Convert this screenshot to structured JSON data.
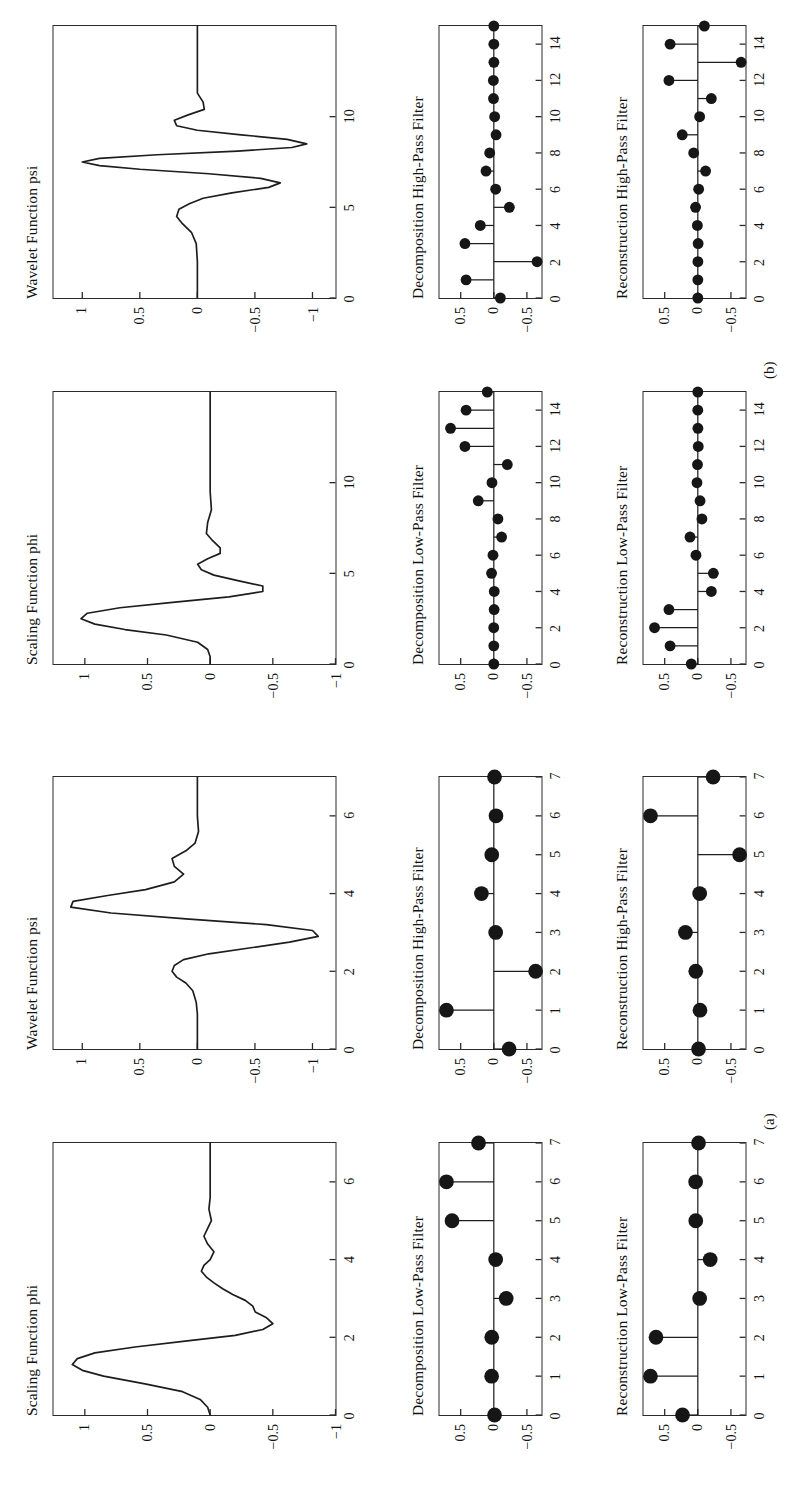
{
  "figure": {
    "panel_a_label": "(a)",
    "panel_b_label": "(b)",
    "titles": {
      "scaling": "Scaling Function phi",
      "wavelet": "Wavelet Function psi",
      "dec_low": "Decomposition Low-Pass Filter",
      "dec_high": "Decomposition High-Pass Filter",
      "rec_low": "Reconstruction Low-Pass Filter",
      "rec_high": "Reconstruction High-Pass Filter"
    }
  },
  "chart_data": [
    {
      "id": "a-scaling",
      "panel": "(a)",
      "type": "line",
      "title": "Scaling Function phi",
      "xlabel": "",
      "ylabel": "",
      "xlim": [
        0,
        7
      ],
      "ylim": [
        -1,
        1.25
      ],
      "xticks": [
        0,
        2,
        4,
        6
      ],
      "xticklabels": [
        "0",
        "2",
        "4",
        "6"
      ],
      "yticks": [
        -1,
        -0.5,
        0,
        0.5,
        1
      ],
      "yticklabels": [
        "-1",
        "-0.5",
        "0",
        "0.5",
        "1"
      ],
      "grid": false,
      "legend": false,
      "x": [
        0,
        0.2,
        0.4,
        0.6,
        0.8,
        1.0,
        1.15,
        1.3,
        1.45,
        1.6,
        1.75,
        1.9,
        2.05,
        2.2,
        2.35,
        2.5,
        2.65,
        2.8,
        2.95,
        3.1,
        3.25,
        3.4,
        3.55,
        3.7,
        3.85,
        4.0,
        4.2,
        4.4,
        4.6,
        4.8,
        5.0,
        5.3,
        5.6,
        6.0,
        6.5,
        7.0
      ],
      "y": [
        0.0,
        0.02,
        0.08,
        0.22,
        0.52,
        0.85,
        1.02,
        1.1,
        1.06,
        0.92,
        0.6,
        0.2,
        -0.2,
        -0.42,
        -0.5,
        -0.45,
        -0.36,
        -0.34,
        -0.28,
        -0.18,
        -0.1,
        -0.03,
        0.03,
        0.07,
        0.05,
        0.0,
        -0.03,
        0.02,
        0.05,
        0.02,
        -0.01,
        0.01,
        0.0,
        0.0,
        0.0,
        0.0
      ]
    },
    {
      "id": "a-wavelet",
      "panel": "(a)",
      "type": "line",
      "title": "Wavelet Function psi",
      "xlabel": "",
      "ylabel": "",
      "xlim": [
        0,
        7
      ],
      "ylim": [
        -1.2,
        1.25
      ],
      "xticks": [
        0,
        2,
        4,
        6
      ],
      "xticklabels": [
        "0",
        "2",
        "4",
        "6"
      ],
      "yticks": [
        -1,
        -0.5,
        0,
        0.5,
        1
      ],
      "yticklabels": [
        "-1",
        "-0.5",
        "0",
        "0.5",
        "1"
      ],
      "grid": false,
      "legend": false,
      "x": [
        0,
        0.3,
        0.6,
        0.9,
        1.2,
        1.5,
        1.7,
        1.85,
        2.0,
        2.15,
        2.3,
        2.45,
        2.6,
        2.75,
        2.9,
        3.05,
        3.2,
        3.35,
        3.5,
        3.65,
        3.8,
        3.95,
        4.1,
        4.3,
        4.5,
        4.7,
        4.9,
        5.1,
        5.3,
        5.6,
        6.0,
        6.4,
        6.7,
        7.0
      ],
      "y": [
        0.0,
        0.0,
        0.0,
        0.0,
        0.01,
        0.04,
        0.1,
        0.18,
        0.22,
        0.2,
        0.12,
        -0.1,
        -0.45,
        -0.8,
        -1.05,
        -1.0,
        -0.6,
        0.1,
        0.75,
        1.1,
        1.08,
        0.78,
        0.45,
        0.2,
        0.12,
        0.2,
        0.22,
        0.1,
        0.02,
        -0.01,
        0.0,
        0.0,
        0.0,
        0.0
      ]
    },
    {
      "id": "a-dec-low",
      "panel": "(a)",
      "type": "stem",
      "title": "Decomposition Low-Pass Filter",
      "xlabel": "",
      "ylabel": "",
      "xlim": [
        0,
        7
      ],
      "ylim": [
        -0.72,
        0.82
      ],
      "xticks": [
        0,
        1,
        2,
        3,
        4,
        5,
        6,
        7
      ],
      "xticklabels": [
        "0",
        "1",
        "2",
        "3",
        "4",
        "5",
        "6",
        "7"
      ],
      "yticks": [
        -0.5,
        0,
        0.5
      ],
      "yticklabels": [
        "-0.5",
        "0",
        "0.5"
      ],
      "grid": false,
      "legend": false,
      "x": [
        0,
        1,
        2,
        3,
        4,
        5,
        6,
        7
      ],
      "values": [
        -0.011,
        0.033,
        0.031,
        -0.187,
        -0.028,
        0.631,
        0.715,
        0.231
      ]
    },
    {
      "id": "a-dec-high",
      "panel": "(a)",
      "type": "stem",
      "title": "Decomposition High-Pass Filter",
      "xlabel": "",
      "ylabel": "",
      "xlim": [
        0,
        7
      ],
      "ylim": [
        -0.72,
        0.82
      ],
      "xticks": [
        0,
        1,
        2,
        3,
        4,
        5,
        6,
        7
      ],
      "xticklabels": [
        "0",
        "1",
        "2",
        "3",
        "4",
        "5",
        "6",
        "7"
      ],
      "yticks": [
        -0.5,
        0,
        0.5
      ],
      "yticklabels": [
        "-0.5",
        "0",
        "0.5"
      ],
      "grid": false,
      "legend": false,
      "x": [
        0,
        1,
        2,
        3,
        4,
        5,
        6,
        7
      ],
      "values": [
        -0.231,
        0.715,
        -0.631,
        -0.028,
        0.187,
        0.031,
        -0.033,
        -0.011
      ]
    },
    {
      "id": "a-rec-low",
      "panel": "(a)",
      "type": "stem",
      "title": "Reconstruction Low-Pass Filter",
      "xlabel": "",
      "ylabel": "",
      "xlim": [
        0,
        7
      ],
      "ylim": [
        -0.72,
        0.82
      ],
      "xticks": [
        0,
        1,
        2,
        3,
        4,
        5,
        6,
        7
      ],
      "xticklabels": [
        "0",
        "1",
        "2",
        "3",
        "4",
        "5",
        "6",
        "7"
      ],
      "yticks": [
        -0.5,
        0,
        0.5
      ],
      "yticklabels": [
        "-0.5",
        "0",
        "0.5"
      ],
      "grid": false,
      "legend": false,
      "x": [
        0,
        1,
        2,
        3,
        4,
        5,
        6,
        7
      ],
      "values": [
        0.231,
        0.715,
        0.631,
        -0.028,
        -0.187,
        0.031,
        0.033,
        -0.011
      ]
    },
    {
      "id": "a-rec-high",
      "panel": "(a)",
      "type": "stem",
      "title": "Reconstruction High-Pass Filter",
      "xlabel": "",
      "ylabel": "",
      "xlim": [
        0,
        7
      ],
      "ylim": [
        -0.72,
        0.82
      ],
      "xticks": [
        0,
        1,
        2,
        3,
        4,
        5,
        6,
        7
      ],
      "xticklabels": [
        "0",
        "1",
        "2",
        "3",
        "4",
        "5",
        "6",
        "7"
      ],
      "yticks": [
        -0.5,
        0,
        0.5
      ],
      "yticklabels": [
        "-0.5",
        "0",
        "0.5"
      ],
      "grid": false,
      "legend": false,
      "x": [
        0,
        1,
        2,
        3,
        4,
        5,
        6,
        7
      ],
      "values": [
        -0.011,
        -0.033,
        0.031,
        0.187,
        -0.028,
        -0.631,
        0.715,
        -0.231
      ]
    },
    {
      "id": "b-scaling",
      "panel": "(b)",
      "type": "line",
      "title": "Scaling Function phi",
      "xlabel": "",
      "ylabel": "",
      "xlim": [
        0,
        15
      ],
      "ylim": [
        -1,
        1.25
      ],
      "xticks": [
        0,
        5,
        10
      ],
      "xticklabels": [
        "0",
        "5",
        "10"
      ],
      "yticks": [
        -1,
        -0.5,
        0,
        0.5,
        1
      ],
      "yticklabels": [
        "-1",
        "-0.5",
        "0",
        "0.5",
        "1"
      ],
      "grid": false,
      "legend": false,
      "x": [
        0,
        0.4,
        0.8,
        1.2,
        1.6,
        1.9,
        2.2,
        2.5,
        2.8,
        3.1,
        3.4,
        3.7,
        4.0,
        4.3,
        4.6,
        4.9,
        5.2,
        5.5,
        5.8,
        6.1,
        6.4,
        6.8,
        7.2,
        7.8,
        8.5,
        9.5,
        11,
        13,
        15
      ],
      "y": [
        0.0,
        0.0,
        0.02,
        0.1,
        0.35,
        0.68,
        0.92,
        1.03,
        0.98,
        0.72,
        0.3,
        -0.15,
        -0.42,
        -0.42,
        -0.22,
        -0.03,
        0.07,
        0.1,
        0.02,
        -0.08,
        -0.08,
        -0.02,
        0.03,
        0.02,
        -0.01,
        0.0,
        0.0,
        0.0,
        0.0
      ]
    },
    {
      "id": "b-wavelet",
      "panel": "(b)",
      "type": "line",
      "title": "Wavelet Function psi",
      "xlabel": "",
      "ylabel": "",
      "xlim": [
        0,
        15
      ],
      "ylim": [
        -1.2,
        1.25
      ],
      "xticks": [
        0,
        5,
        10
      ],
      "xticklabels": [
        "0",
        "5",
        "10"
      ],
      "yticks": [
        -1,
        -0.5,
        0,
        0.5,
        1
      ],
      "yticklabels": [
        "-1",
        "-0.5",
        "0",
        "0.5",
        "1"
      ],
      "grid": false,
      "legend": false,
      "x": [
        0,
        1,
        2,
        3,
        3.6,
        4.1,
        4.5,
        4.9,
        5.2,
        5.5,
        5.8,
        6.1,
        6.35,
        6.6,
        6.85,
        7.1,
        7.3,
        7.5,
        7.7,
        7.9,
        8.1,
        8.3,
        8.5,
        8.75,
        9.0,
        9.25,
        9.5,
        9.8,
        10.1,
        10.4,
        10.8,
        11.3,
        12,
        13,
        15
      ],
      "y": [
        0.0,
        0.0,
        0.0,
        0.01,
        0.05,
        0.13,
        0.18,
        0.16,
        0.07,
        -0.05,
        -0.3,
        -0.62,
        -0.72,
        -0.55,
        -0.1,
        0.5,
        0.85,
        1.0,
        0.85,
        0.35,
        -0.35,
        -0.82,
        -0.95,
        -0.78,
        -0.38,
        0.0,
        0.18,
        0.2,
        0.08,
        -0.06,
        -0.05,
        0.0,
        0.0,
        0.0,
        0.0
      ]
    },
    {
      "id": "b-dec-low",
      "panel": "(b)",
      "type": "stem",
      "title": "Decomposition Low-Pass Filter",
      "xlabel": "",
      "ylabel": "",
      "xlim": [
        0,
        15
      ],
      "ylim": [
        -0.72,
        0.82
      ],
      "xticks": [
        0,
        2,
        4,
        6,
        8,
        10,
        12,
        14
      ],
      "xticklabels": [
        "0",
        "2",
        "4",
        "6",
        "8",
        "10",
        "12",
        "14"
      ],
      "yticks": [
        -0.5,
        0,
        0.5
      ],
      "yticklabels": [
        "-0.5",
        "0",
        "0.5"
      ],
      "grid": false,
      "legend": false,
      "x": [
        0,
        1,
        2,
        3,
        4,
        5,
        6,
        7,
        8,
        9,
        10,
        11,
        12,
        13,
        14,
        15
      ],
      "values": [
        -0.0002,
        0.0004,
        0.0012,
        -0.0049,
        -0.0067,
        0.0339,
        0.0126,
        -0.1178,
        -0.0622,
        0.2348,
        0.0278,
        -0.2041,
        0.4359,
        0.6533,
        0.4186,
        0.0988
      ]
    },
    {
      "id": "b-dec-high",
      "panel": "(b)",
      "type": "stem",
      "title": "Decomposition High-Pass Filter",
      "xlabel": "",
      "ylabel": "",
      "xlim": [
        0,
        15
      ],
      "ylim": [
        -0.72,
        0.82
      ],
      "xticks": [
        0,
        2,
        4,
        6,
        8,
        10,
        12,
        14
      ],
      "xticklabels": [
        "0",
        "2",
        "4",
        "6",
        "8",
        "10",
        "12",
        "14"
      ],
      "yticks": [
        -0.5,
        0,
        0.5
      ],
      "yticklabels": [
        "-0.5",
        "0",
        "0.5"
      ],
      "grid": false,
      "legend": false,
      "x": [
        0,
        1,
        2,
        3,
        4,
        5,
        6,
        7,
        8,
        9,
        10,
        11,
        12,
        13,
        14,
        15
      ],
      "values": [
        -0.0988,
        0.4186,
        -0.6533,
        0.4359,
        0.2041,
        -0.2348,
        -0.0278,
        0.1178,
        0.0622,
        -0.0339,
        -0.0126,
        0.0049,
        0.0067,
        -0.0012,
        -0.0004,
        -0.0002
      ]
    },
    {
      "id": "b-rec-low",
      "panel": "(b)",
      "type": "stem",
      "title": "Reconstruction Low-Pass Filter",
      "xlabel": "",
      "ylabel": "",
      "xlim": [
        0,
        15
      ],
      "ylim": [
        -0.72,
        0.82
      ],
      "xticks": [
        0,
        2,
        4,
        6,
        8,
        10,
        12,
        14
      ],
      "xticklabels": [
        "0",
        "2",
        "4",
        "6",
        "8",
        "10",
        "12",
        "14"
      ],
      "yticks": [
        -0.5,
        0,
        0.5
      ],
      "yticklabels": [
        "-0.5",
        "0",
        "0.5"
      ],
      "grid": false,
      "legend": false,
      "x": [
        0,
        1,
        2,
        3,
        4,
        5,
        6,
        7,
        8,
        9,
        10,
        11,
        12,
        13,
        14,
        15
      ],
      "values": [
        0.0988,
        0.4186,
        0.6533,
        0.4359,
        -0.2041,
        -0.2348,
        0.0278,
        0.1178,
        -0.0622,
        -0.0339,
        0.0126,
        0.0049,
        -0.0067,
        -0.0012,
        0.0004,
        -0.0002
      ]
    },
    {
      "id": "b-rec-high",
      "panel": "(b)",
      "type": "stem",
      "title": "Reconstruction High-Pass Filter",
      "xlabel": "",
      "ylabel": "",
      "xlim": [
        0,
        15
      ],
      "ylim": [
        -0.72,
        0.82
      ],
      "xticks": [
        0,
        2,
        4,
        6,
        8,
        10,
        12,
        14
      ],
      "xticklabels": [
        "0",
        "2",
        "4",
        "6",
        "8",
        "10",
        "12",
        "14"
      ],
      "yticks": [
        -0.5,
        0,
        0.5
      ],
      "yticklabels": [
        "-0.5",
        "0",
        "0.5"
      ],
      "grid": false,
      "legend": false,
      "x": [
        0,
        1,
        2,
        3,
        4,
        5,
        6,
        7,
        8,
        9,
        10,
        11,
        12,
        13,
        14,
        15
      ],
      "values": [
        -0.0002,
        -0.0004,
        -0.0012,
        -0.0049,
        0.0067,
        0.0339,
        -0.0126,
        -0.1178,
        0.0622,
        0.2348,
        -0.0278,
        -0.2041,
        0.4359,
        -0.6533,
        0.4186,
        -0.0988
      ]
    }
  ]
}
